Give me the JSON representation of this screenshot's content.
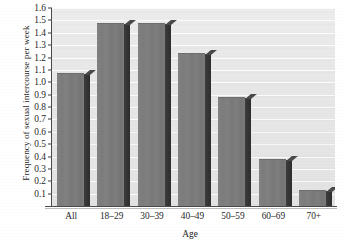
{
  "chart_data": {
    "type": "bar",
    "title": "",
    "xlabel": "Age",
    "ylabel": "Frequency of sexual intercourse per week",
    "categories": [
      "All",
      "18–29",
      "30–39",
      "40–49",
      "50–59",
      "60–69",
      "70+"
    ],
    "values": [
      1.07,
      1.47,
      1.47,
      1.23,
      0.87,
      0.37,
      0.12
    ],
    "ylim": [
      0,
      1.6
    ],
    "ytick_labels": [
      "1.6",
      "1.5",
      "1.4",
      "1.3",
      "1.2",
      "1.1",
      "1.0",
      "0.9",
      "0.8",
      "0.7",
      "0.6",
      "0.5",
      "0.4",
      "0.3",
      "0.2",
      "0.1"
    ],
    "ytick_values": [
      1.6,
      1.5,
      1.4,
      1.3,
      1.2,
      1.1,
      1.0,
      0.9,
      0.8,
      0.7,
      0.6,
      0.5,
      0.4,
      0.3,
      0.2,
      0.1
    ],
    "ytick_step": 0.1,
    "grid": true,
    "grid_orientation": "horizontal",
    "legend": false,
    "legend_position": "none",
    "bar_style": "3d-shaded",
    "colors": {
      "bar_front": "#7c7c7c",
      "bar_side": "#363636",
      "plot_background": "#e7e7e7",
      "gridline": "#ffffff",
      "axis": "#4a4a4a",
      "text": "#1f1f1f",
      "page_background": "#ffffff"
    }
  }
}
